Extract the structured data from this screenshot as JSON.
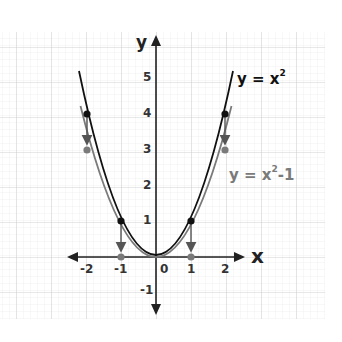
{
  "diagram": {
    "type": "function-graph",
    "x_axis_label": "x",
    "y_axis_label": "y",
    "x_ticks": [
      "-2",
      "-1",
      "0",
      "1",
      "2"
    ],
    "y_ticks": [
      "5",
      "4",
      "3",
      "2",
      "1",
      "-1"
    ],
    "curves": [
      {
        "name": "y = x^2",
        "label_prefix": "y = x",
        "label_exp": "2",
        "label_suffix": "",
        "color": "#111111",
        "points": [
          [
            -2,
            4
          ],
          [
            -1,
            1
          ],
          [
            1,
            1
          ],
          [
            2,
            4
          ]
        ]
      },
      {
        "name": "y = x^2 - 1",
        "label_prefix": "y = x",
        "label_exp": "2",
        "label_suffix": "-1",
        "color": "#7a7a7a",
        "points": [
          [
            -2,
            3
          ],
          [
            -1,
            0
          ],
          [
            1,
            0
          ],
          [
            2,
            3
          ]
        ]
      }
    ],
    "arrows": [
      {
        "from": [
          -2,
          4
        ],
        "to": [
          -2,
          3
        ]
      },
      {
        "from": [
          -1,
          1
        ],
        "to": [
          -1,
          0
        ]
      },
      {
        "from": [
          1,
          1
        ],
        "to": [
          1,
          0
        ]
      },
      {
        "from": [
          2,
          4
        ],
        "to": [
          2,
          3
        ]
      }
    ],
    "grid": {
      "major_color": "#cfcfcf",
      "minor_color": "#e8e8e8"
    }
  }
}
